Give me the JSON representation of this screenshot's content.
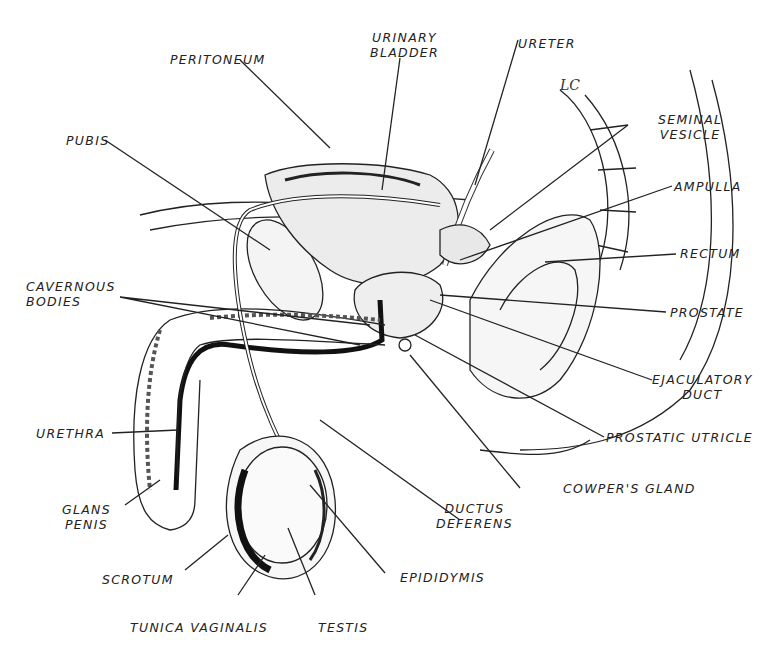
{
  "figure": {
    "type": "anatomical-illustration",
    "artist_mark": "LC",
    "labels": {
      "peritoneum": "PERITONEUM",
      "urinary_bladder": "URINARY\nBLADDER",
      "ureter": "URETER",
      "seminal_vesicle": "SEMINAL\nVESICLE",
      "pubis": "PUBIS",
      "ampulla": "AMPULLA",
      "rectum": "RECTUM",
      "cavernous_bodies": "CAVERNOUS\nBODIES",
      "prostate": "PROSTATE",
      "ejaculatory_duct": "EJACULATORY\nDUCT",
      "urethra": "URETHRA",
      "prostatic_utricle": "PROSTATIC UTRICLE",
      "cowpers_gland": "COWPER'S GLAND",
      "glans_penis": "GLANS\nPENIS",
      "ductus_deferens": "DUCTUS\nDEFERENS",
      "epididymis": "EPIDIDYMIS",
      "scrotum": "SCROTUM",
      "tunica_vaginalis": "TUNICA VAGINALIS",
      "testis": "TESTIS"
    },
    "colors": {
      "ink": "#222222",
      "background": "#ffffff",
      "fill_dark": "#111111"
    }
  }
}
